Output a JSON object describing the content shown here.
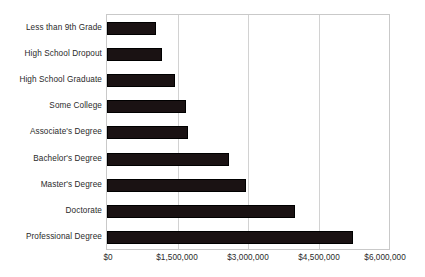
{
  "chart_data": {
    "type": "bar",
    "orientation": "horizontal",
    "title": "",
    "subtitle": "",
    "xlabel": "",
    "ylabel": "",
    "categories": [
      "Less than 9th Grade",
      "High School Dropout",
      "High School Graduate",
      "Some College",
      "Associate's Degree",
      "Bachelor's Degree",
      "Master's Degree",
      "Doctorate",
      "Professional Degree"
    ],
    "values": [
      1050000,
      1180000,
      1440000,
      1690000,
      1730000,
      2600000,
      2960000,
      3990000,
      5240000
    ],
    "xlim": [
      0,
      6000000
    ],
    "xticks": [
      0,
      1500000,
      3000000,
      4500000,
      6000000
    ],
    "xtick_labels": [
      "$0",
      "$1,500,000",
      "$3,000,000",
      "$4,500,000",
      "$6,000,000"
    ],
    "grid": true,
    "grid_axis": "x",
    "legend": null,
    "legend_position": "none",
    "bar_color": "#1a1213",
    "grid_color": "#d2d2d2",
    "axis_border_color": "#c9c9c9",
    "text_color": "#2a2a2a",
    "background_color": "#ffffff"
  }
}
